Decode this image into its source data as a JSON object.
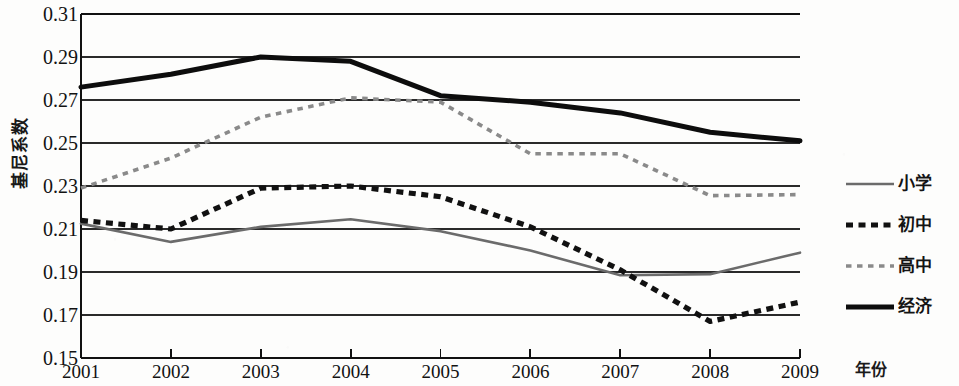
{
  "chart_data": {
    "type": "line",
    "title": "",
    "xlabel": "年份",
    "ylabel": "基尼系数",
    "x": [
      2001,
      2002,
      2003,
      2004,
      2005,
      2006,
      2007,
      2008,
      2009
    ],
    "xtick_labels": [
      "2001",
      "2002",
      "2003",
      "2004",
      "2005",
      "2006",
      "2007",
      "2008",
      "2009"
    ],
    "ytick_labels": [
      "0.31",
      "0.29",
      "0.27",
      "0.25",
      "0.23",
      "0.21",
      "0.19",
      "0.17",
      "0.15"
    ],
    "ytick_values": [
      0.31,
      0.29,
      0.27,
      0.25,
      0.23,
      0.21,
      0.19,
      0.17,
      0.15
    ],
    "ylim": [
      0.15,
      0.31
    ],
    "xlim": [
      2001,
      2009
    ],
    "grid": "horizontal",
    "legend_position": "right",
    "series": [
      {
        "name": "小学",
        "style": "solid-thin",
        "color": "#6b6b6b",
        "values": [
          0.2125,
          0.204,
          0.211,
          0.2145,
          0.209,
          0.2,
          0.1885,
          0.189,
          0.199
        ]
      },
      {
        "name": "初中",
        "style": "dashed-thick",
        "color": "#111111",
        "values": [
          0.214,
          0.21,
          0.229,
          0.23,
          0.225,
          0.211,
          0.191,
          0.167,
          0.176
        ]
      },
      {
        "name": "高中",
        "style": "dotted",
        "color": "#8a8a8a",
        "values": [
          0.229,
          0.243,
          0.262,
          0.271,
          0.269,
          0.245,
          0.245,
          0.2255,
          0.226
        ]
      },
      {
        "name": "经济",
        "style": "solid-thick",
        "color": "#0d0d0d",
        "values": [
          0.276,
          0.282,
          0.29,
          0.288,
          0.272,
          0.269,
          0.264,
          0.255,
          0.251
        ]
      }
    ]
  },
  "axes": {
    "y_title": "基尼系数",
    "x_title": "年份"
  },
  "legend": {
    "items": [
      {
        "label": "小学",
        "swatch": "solid-thin-gray-line-icon"
      },
      {
        "label": "初中",
        "swatch": "thick-dashed-black-line-icon"
      },
      {
        "label": "高中",
        "swatch": "dotted-gray-line-icon"
      },
      {
        "label": "经济",
        "swatch": "thick-solid-black-line-icon"
      }
    ]
  }
}
